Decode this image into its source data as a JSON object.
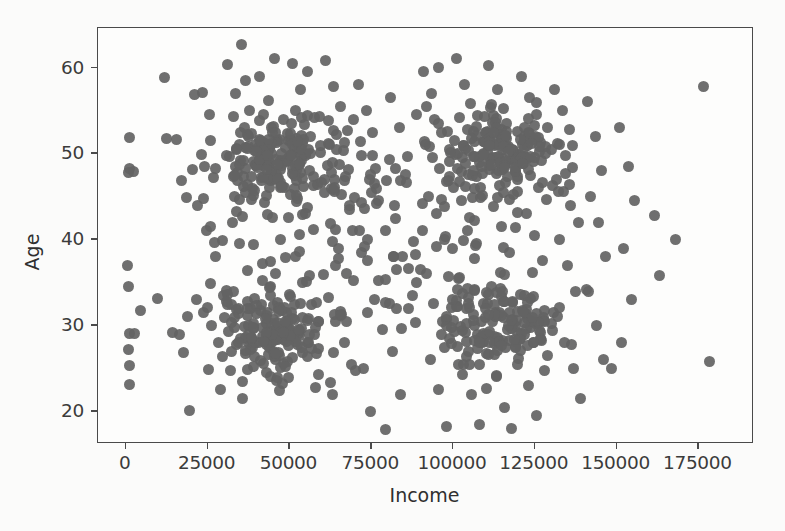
{
  "figure": {
    "background_color": "#fbfbfa",
    "plot_background_color": "#fdfdfc",
    "frame_color": "#4a4a4a",
    "marker_color": "#636363"
  },
  "chart_data": {
    "type": "scatter",
    "title": "",
    "xlabel": "Income",
    "ylabel": "Age",
    "xlim": [
      -8500,
      192000
    ],
    "ylim": [
      16.2,
      64.6
    ],
    "xticks": [
      0,
      25000,
      50000,
      75000,
      100000,
      125000,
      150000,
      175000
    ],
    "xticklabels": [
      "0",
      "25000",
      "50000",
      "75000",
      "100000",
      "125000",
      "150000",
      "175000"
    ],
    "yticks": [
      20,
      30,
      40,
      50,
      60
    ],
    "yticklabels": [
      "20",
      "30",
      "40",
      "50",
      "60"
    ],
    "grid": false,
    "legend": null,
    "marker_size_px": 11,
    "n_points": 700,
    "clusters": [
      {
        "name": "low-income-older",
        "x_center": 47000,
        "y_center": 49.5,
        "x_spread": 15000,
        "y_spread": 4.2,
        "count": 150
      },
      {
        "name": "low-income-younger",
        "x_center": 45000,
        "y_center": 29.5,
        "x_spread": 15000,
        "y_spread": 4.2,
        "count": 150
      },
      {
        "name": "high-income-older",
        "x_center": 115000,
        "y_center": 50.0,
        "x_spread": 15000,
        "y_spread": 4.0,
        "count": 140
      },
      {
        "name": "high-income-younger",
        "x_center": 115000,
        "y_center": 30.0,
        "x_spread": 15000,
        "y_spread": 4.2,
        "count": 140
      },
      {
        "name": "diffuse-background",
        "x_center": 75000,
        "y_center": 41.0,
        "x_spread": 48000,
        "y_spread": 12.5,
        "count": 118
      }
    ],
    "outliers": [
      {
        "x": 176500,
        "y": 57.8
      },
      {
        "x": 178500,
        "y": 25.8
      },
      {
        "x": 168000,
        "y": 40.0
      },
      {
        "x": 161500,
        "y": 42.8
      },
      {
        "x": 163000,
        "y": 35.8
      }
    ],
    "points": [
      [
        1200,
        48.2
      ],
      [
        900,
        47.8
      ],
      [
        2400,
        47.9
      ],
      [
        1100,
        51.9
      ],
      [
        600,
        37.0
      ],
      [
        800,
        34.5
      ],
      [
        1000,
        29.1
      ],
      [
        2600,
        29.0
      ],
      [
        900,
        27.2
      ],
      [
        1100,
        25.3
      ],
      [
        1000,
        23.1
      ],
      [
        11800,
        58.8
      ],
      [
        12500,
        51.8
      ],
      [
        15500,
        51.6
      ],
      [
        17000,
        46.9
      ],
      [
        18500,
        44.9
      ],
      [
        14200,
        29.2
      ],
      [
        16500,
        28.9
      ],
      [
        19000,
        31.0
      ],
      [
        17600,
        26.8
      ],
      [
        19500,
        20.1
      ],
      [
        21000,
        56.9
      ],
      [
        23500,
        57.1
      ],
      [
        25500,
        54.5
      ],
      [
        24000,
        48.5
      ],
      [
        26800,
        47.2
      ],
      [
        22000,
        44.0
      ],
      [
        24700,
        41.0
      ],
      [
        27500,
        38.0
      ],
      [
        21500,
        33.0
      ],
      [
        23800,
        31.5
      ],
      [
        26100,
        30.0
      ],
      [
        28400,
        28.0
      ],
      [
        25300,
        24.9
      ],
      [
        29000,
        22.5
      ],
      [
        31000,
        60.3
      ],
      [
        33500,
        57.0
      ],
      [
        35500,
        62.7
      ],
      [
        36500,
        58.5
      ],
      [
        33000,
        54.3
      ],
      [
        35000,
        52.4
      ],
      [
        37500,
        50.8
      ],
      [
        31800,
        49.6
      ],
      [
        34200,
        47.8
      ],
      [
        36000,
        46.2
      ],
      [
        38500,
        44.7
      ],
      [
        32500,
        42.0
      ],
      [
        34800,
        39.5
      ],
      [
        37200,
        36.4
      ],
      [
        31200,
        33.6
      ],
      [
        33900,
        31.8
      ],
      [
        36300,
        29.9
      ],
      [
        38800,
        27.4
      ],
      [
        32100,
        24.8
      ],
      [
        35700,
        21.5
      ],
      [
        41000,
        59.0
      ],
      [
        43500,
        56.2
      ],
      [
        45500,
        61.0
      ],
      [
        42000,
        54.5
      ],
      [
        44500,
        53.0
      ],
      [
        46500,
        51.5
      ],
      [
        41500,
        50.2
      ],
      [
        43800,
        48.9
      ],
      [
        46000,
        47.5
      ],
      [
        48500,
        46.0
      ],
      [
        42500,
        44.3
      ],
      [
        44900,
        42.6
      ],
      [
        47300,
        40.0
      ],
      [
        41800,
        37.2
      ],
      [
        44100,
        34.5
      ],
      [
        46700,
        32.0
      ],
      [
        49000,
        30.2
      ],
      [
        43200,
        28.5
      ],
      [
        45600,
        26.0
      ],
      [
        48000,
        23.2
      ],
      [
        51000,
        60.5
      ],
      [
        53500,
        57.5
      ],
      [
        55500,
        59.5
      ],
      [
        52000,
        55.0
      ],
      [
        54500,
        53.4
      ],
      [
        56500,
        52.0
      ],
      [
        51500,
        50.6
      ],
      [
        53800,
        49.2
      ],
      [
        56000,
        48.0
      ],
      [
        58500,
        46.4
      ],
      [
        52500,
        44.8
      ],
      [
        54900,
        43.0
      ],
      [
        57300,
        41.2
      ],
      [
        51800,
        38.0
      ],
      [
        54100,
        35.0
      ],
      [
        56700,
        32.4
      ],
      [
        59000,
        30.5
      ],
      [
        53200,
        28.8
      ],
      [
        55600,
        26.4
      ],
      [
        58000,
        22.8
      ],
      [
        61000,
        60.8
      ],
      [
        63500,
        57.8
      ],
      [
        65500,
        55.5
      ],
      [
        62000,
        53.8
      ],
      [
        64500,
        52.2
      ],
      [
        66500,
        50.4
      ],
      [
        61500,
        48.6
      ],
      [
        63800,
        47.0
      ],
      [
        66000,
        45.2
      ],
      [
        68500,
        43.5
      ],
      [
        62500,
        41.8
      ],
      [
        64900,
        39.0
      ],
      [
        67300,
        36.0
      ],
      [
        61800,
        33.2
      ],
      [
        64100,
        30.4
      ],
      [
        66700,
        28.0
      ],
      [
        69000,
        25.5
      ],
      [
        63200,
        22.0
      ],
      [
        71000,
        58.0
      ],
      [
        73500,
        55.0
      ],
      [
        75500,
        52.5
      ],
      [
        72000,
        49.8
      ],
      [
        74500,
        47.0
      ],
      [
        76500,
        44.2
      ],
      [
        71500,
        41.0
      ],
      [
        73800,
        37.5
      ],
      [
        76000,
        33.0
      ],
      [
        78500,
        29.5
      ],
      [
        72500,
        25.0
      ],
      [
        74900,
        20.0
      ],
      [
        79500,
        17.9
      ],
      [
        81000,
        56.5
      ],
      [
        83500,
        53.0
      ],
      [
        85500,
        47.5
      ],
      [
        82000,
        44.0
      ],
      [
        84500,
        38.0
      ],
      [
        86500,
        32.0
      ],
      [
        81500,
        27.0
      ],
      [
        84000,
        22.0
      ],
      [
        91000,
        59.5
      ],
      [
        93500,
        57.0
      ],
      [
        95500,
        60.0
      ],
      [
        92000,
        55.5
      ],
      [
        94500,
        54.0
      ],
      [
        96500,
        52.5
      ],
      [
        91500,
        51.0
      ],
      [
        93800,
        49.5
      ],
      [
        96000,
        48.2
      ],
      [
        98500,
        46.8
      ],
      [
        92500,
        45.0
      ],
      [
        94900,
        43.0
      ],
      [
        97300,
        40.0
      ],
      [
        91800,
        36.0
      ],
      [
        94100,
        32.5
      ],
      [
        96700,
        30.5
      ],
      [
        99000,
        28.5
      ],
      [
        93200,
        26.0
      ],
      [
        95600,
        22.5
      ],
      [
        98000,
        18.2
      ],
      [
        101000,
        61.0
      ],
      [
        103500,
        58.0
      ],
      [
        105500,
        55.8
      ],
      [
        102000,
        54.2
      ],
      [
        104500,
        52.8
      ],
      [
        106500,
        51.4
      ],
      [
        101500,
        50.0
      ],
      [
        103800,
        48.8
      ],
      [
        106000,
        47.4
      ],
      [
        108500,
        46.0
      ],
      [
        102500,
        44.5
      ],
      [
        104900,
        42.5
      ],
      [
        107300,
        39.5
      ],
      [
        101800,
        35.5
      ],
      [
        104100,
        32.0
      ],
      [
        106700,
        30.0
      ],
      [
        109000,
        28.0
      ],
      [
        103200,
        25.5
      ],
      [
        105600,
        22.0
      ],
      [
        108000,
        18.5
      ],
      [
        111000,
        60.2
      ],
      [
        113500,
        57.4
      ],
      [
        115500,
        55.2
      ],
      [
        112000,
        53.6
      ],
      [
        114500,
        52.2
      ],
      [
        116500,
        50.8
      ],
      [
        111500,
        49.4
      ],
      [
        113800,
        48.0
      ],
      [
        116000,
        46.6
      ],
      [
        118500,
        45.2
      ],
      [
        112500,
        43.8
      ],
      [
        114900,
        41.5
      ],
      [
        117300,
        38.5
      ],
      [
        111800,
        34.5
      ],
      [
        114100,
        31.5
      ],
      [
        116700,
        29.5
      ],
      [
        119000,
        27.5
      ],
      [
        113200,
        24.0
      ],
      [
        115600,
        20.5
      ],
      [
        118000,
        18.0
      ],
      [
        121000,
        59.0
      ],
      [
        123500,
        56.5
      ],
      [
        125500,
        54.5
      ],
      [
        122000,
        53.0
      ],
      [
        124500,
        51.6
      ],
      [
        126500,
        50.2
      ],
      [
        121500,
        48.8
      ],
      [
        123800,
        47.4
      ],
      [
        126000,
        46.0
      ],
      [
        128500,
        44.6
      ],
      [
        122500,
        43.0
      ],
      [
        124900,
        40.5
      ],
      [
        127300,
        37.5
      ],
      [
        121800,
        33.5
      ],
      [
        124100,
        30.5
      ],
      [
        126700,
        28.5
      ],
      [
        129000,
        26.5
      ],
      [
        123200,
        23.0
      ],
      [
        125600,
        19.5
      ],
      [
        131000,
        57.5
      ],
      [
        133500,
        55.0
      ],
      [
        135500,
        52.8
      ],
      [
        132000,
        51.2
      ],
      [
        134500,
        49.8
      ],
      [
        136500,
        48.4
      ],
      [
        131500,
        47.0
      ],
      [
        133800,
        45.6
      ],
      [
        136000,
        44.0
      ],
      [
        138500,
        42.0
      ],
      [
        132500,
        40.0
      ],
      [
        134900,
        37.0
      ],
      [
        137300,
        34.0
      ],
      [
        131800,
        31.0
      ],
      [
        134100,
        28.0
      ],
      [
        136700,
        25.0
      ],
      [
        139000,
        21.5
      ],
      [
        141000,
        56.0
      ],
      [
        143500,
        52.0
      ],
      [
        145500,
        48.0
      ],
      [
        142000,
        45.0
      ],
      [
        144500,
        42.0
      ],
      [
        146500,
        38.0
      ],
      [
        141500,
        34.0
      ],
      [
        143800,
        30.0
      ],
      [
        146000,
        26.0
      ],
      [
        148500,
        25.0
      ],
      [
        151000,
        53.0
      ],
      [
        153500,
        48.5
      ],
      [
        155500,
        44.5
      ],
      [
        152000,
        39.0
      ],
      [
        154500,
        33.0
      ],
      [
        151500,
        28.0
      ],
      [
        161500,
        42.8
      ],
      [
        163000,
        35.8
      ],
      [
        168000,
        40.0
      ],
      [
        176500,
        57.8
      ],
      [
        178500,
        25.8
      ]
    ]
  }
}
